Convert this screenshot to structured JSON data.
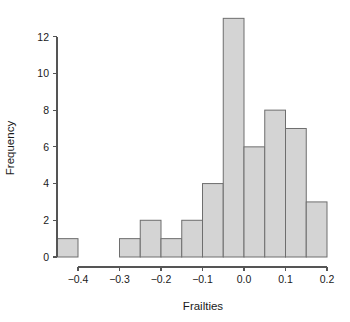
{
  "chart_data": {
    "type": "bar",
    "chart_subtype": "histogram",
    "title": "",
    "xlabel": "Frailties",
    "ylabel": "Frequency",
    "xlim": [
      -0.46,
      0.215
    ],
    "ylim": [
      0,
      13.6
    ],
    "grid": false,
    "legend": null,
    "bin_width": 0.05,
    "bin_edges": [
      -0.45,
      -0.4,
      -0.35,
      -0.3,
      -0.25,
      -0.2,
      -0.15,
      -0.1,
      -0.05,
      0.0,
      0.05,
      0.1,
      0.15,
      0.2
    ],
    "categories": [
      "-0.45..-0.40",
      "-0.40..-0.35",
      "-0.35..-0.30",
      "-0.30..-0.25",
      "-0.25..-0.20",
      "-0.20..-0.15",
      "-0.15..-0.10",
      "-0.10..-0.05",
      "-0.05..0.00",
      "0.00..0.05",
      "0.05..0.10",
      "0.10..0.15",
      "0.15..0.20"
    ],
    "values": [
      1,
      0,
      0,
      1,
      2,
      1,
      2,
      4,
      13,
      6,
      8,
      7,
      3
    ],
    "bars": [
      {
        "x0": -0.45,
        "x1": -0.4,
        "value": 1
      },
      {
        "x0": -0.4,
        "x1": -0.35,
        "value": 0
      },
      {
        "x0": -0.35,
        "x1": -0.3,
        "value": 0
      },
      {
        "x0": -0.3,
        "x1": -0.25,
        "value": 1
      },
      {
        "x0": -0.25,
        "x1": -0.2,
        "value": 2
      },
      {
        "x0": -0.2,
        "x1": -0.15,
        "value": 1
      },
      {
        "x0": -0.15,
        "x1": -0.1,
        "value": 2
      },
      {
        "x0": -0.1,
        "x1": -0.05,
        "value": 4
      },
      {
        "x0": -0.05,
        "x1": 0.0,
        "value": 13
      },
      {
        "x0": 0.0,
        "x1": 0.05,
        "value": 6
      },
      {
        "x0": 0.05,
        "x1": 0.1,
        "value": 8
      },
      {
        "x0": 0.1,
        "x1": 0.15,
        "value": 7
      },
      {
        "x0": 0.15,
        "x1": 0.2,
        "value": 3
      }
    ],
    "xticks": [
      -0.4,
      -0.3,
      -0.2,
      -0.1,
      0.0,
      0.1,
      0.2
    ],
    "xtick_labels": [
      "−0.4",
      "−0.3",
      "−0.2",
      "−0.1",
      "0.0",
      "0.1",
      "0.2"
    ],
    "yticks": [
      0,
      2,
      4,
      6,
      8,
      10,
      12
    ],
    "ytick_labels": [
      "0",
      "2",
      "4",
      "6",
      "8",
      "10",
      "12"
    ],
    "total_count": 41,
    "colors": {
      "bar_fill": "#d4d4d4",
      "bar_stroke": "#6e6e6e",
      "axis": "#555555",
      "text": "#1a1a1a",
      "background": "#ffffff"
    }
  }
}
